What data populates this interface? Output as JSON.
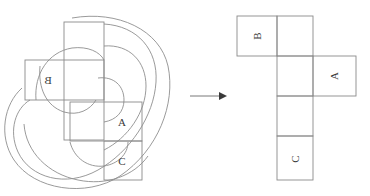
{
  "figure": {
    "background": "#ffffff",
    "stroke_color": "#8a8a8a",
    "label_color": "#3a3a3a",
    "arrow_color": "#555555"
  },
  "left_panel": {
    "name": "knotted-loop-with-overlaid-net",
    "faces": [
      {
        "id": "face-b",
        "label": "B",
        "x": 25,
        "y": 60,
        "w": 79,
        "h": 40,
        "transform": "mirrored-horizontal"
      },
      {
        "id": "face-a",
        "label": "A",
        "x": 70,
        "y": 102,
        "w": 72,
        "h": 39,
        "transform": "upright"
      },
      {
        "id": "face-c",
        "label": "C",
        "x": 104,
        "y": 141,
        "w": 38,
        "h": 39,
        "transform": "upright"
      },
      {
        "id": "face-blank-tall",
        "label": "",
        "x": 64,
        "y": 22,
        "w": 40,
        "h": 118,
        "transform": "upright"
      }
    ],
    "knot_strands": 7
  },
  "arrow": {
    "name": "transformation-arrow",
    "x1": 190,
    "y1": 96,
    "x2": 224,
    "y2": 96,
    "direction": "right"
  },
  "right_panel": {
    "name": "unfolded-cube-net",
    "cells": [
      {
        "id": "net-b",
        "label": "B",
        "x": 237,
        "y": 16,
        "w": 40,
        "h": 40,
        "rotation": -90
      },
      {
        "id": "net-top-right",
        "label": "",
        "x": 277,
        "y": 16,
        "w": 36,
        "h": 40,
        "rotation": 0
      },
      {
        "id": "net-mid",
        "label": "",
        "x": 277,
        "y": 56,
        "w": 36,
        "h": 40,
        "rotation": 0
      },
      {
        "id": "net-a",
        "label": "A",
        "x": 313,
        "y": 56,
        "w": 43,
        "h": 40,
        "rotation": -90
      },
      {
        "id": "net-lower",
        "label": "",
        "x": 277,
        "y": 96,
        "w": 36,
        "h": 40,
        "rotation": 0
      },
      {
        "id": "net-c",
        "label": "C",
        "x": 277,
        "y": 136,
        "w": 36,
        "h": 44,
        "rotation": -90
      }
    ]
  }
}
